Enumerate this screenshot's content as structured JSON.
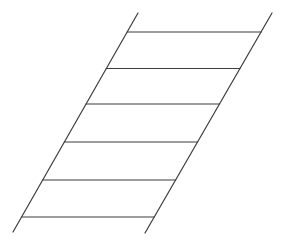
{
  "figure": {
    "type": "line-drawing",
    "canvas": {
      "width": 285,
      "height": 241,
      "background": "#ffffff"
    },
    "style": {
      "stroke_color": "#3d3d3d",
      "stroke_width": 1.2
    },
    "rails": [
      {
        "name": "left-rail",
        "x1": 138,
        "y1": 13,
        "x2": 13,
        "y2": 232
      },
      {
        "name": "right-rail",
        "x1": 272,
        "y1": 13,
        "x2": 145,
        "y2": 233
      }
    ],
    "rungs": [
      {
        "name": "rung-1",
        "x1": 127.2,
        "y1": 32,
        "x2": 261.0,
        "y2": 32
      },
      {
        "name": "rung-2",
        "x1": 106.3,
        "y1": 68.5,
        "x2": 240.0,
        "y2": 68.5
      },
      {
        "name": "rung-3",
        "x1": 86.1,
        "y1": 104,
        "x2": 219.5,
        "y2": 104
      },
      {
        "name": "rung-4",
        "x1": 64.4,
        "y1": 142,
        "x2": 197.5,
        "y2": 142
      },
      {
        "name": "rung-5",
        "x1": 42.7,
        "y1": 180,
        "x2": 175.6,
        "y2": 180
      },
      {
        "name": "rung-6",
        "x1": 21.6,
        "y1": 217,
        "x2": 154.2,
        "y2": 217
      }
    ]
  }
}
